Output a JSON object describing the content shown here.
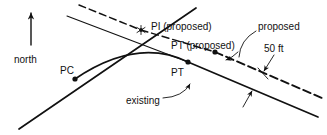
{
  "figure": {
    "background_color": "#ffffff",
    "ink_color": "#111111"
  },
  "labels": {
    "north": "north",
    "pc": "PC",
    "pt": "PT",
    "pi_proposed": "PI (proposed)",
    "pt_proposed": "PT (proposed)",
    "proposed": "proposed",
    "offset": "50 ft",
    "existing": "existing"
  },
  "icons": {
    "north_arrow": "north-arrow-icon",
    "pi_marker": "star-marker-icon",
    "pc_marker": "dot-marker-icon",
    "pt_marker": "dot-marker-icon",
    "pt_proposed_marker": "dot-marker-icon",
    "leader_arrow": "arrowhead-icon"
  },
  "geometry": {
    "back_tangent": "solid line from lower-left through PC up to upper-right past PI",
    "existing_curve": "solid arc from PC to PT",
    "forward_tangent_existing": "solid line from PT descending to lower-right",
    "proposed_tangent": "dashed line parallel above the existing alignment",
    "offset_distance": "50 ft"
  }
}
